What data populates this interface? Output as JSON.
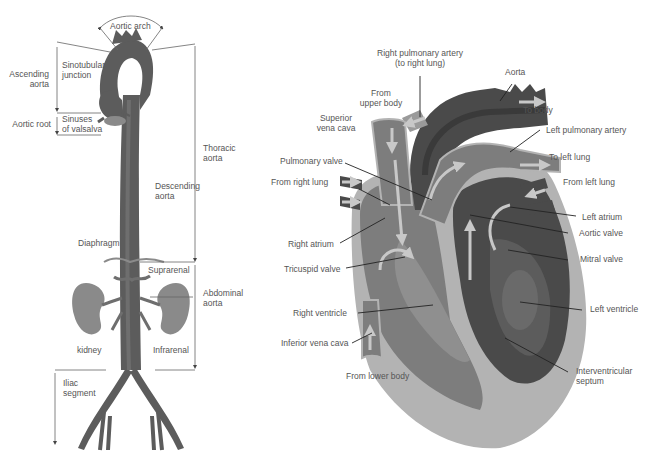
{
  "colors": {
    "background": "#ffffff",
    "label_text": "#555555",
    "leader_line": "#222222",
    "bracket_line": "#666666",
    "aorta_dark": "#5c5c5c",
    "aorta_mid": "#6e6e6e",
    "kidney": "#8a8a8a",
    "heart_outer": "#b3b3b3",
    "heart_mid": "#7d7d7d",
    "heart_dark": "#4a4a4a",
    "heart_darkest": "#3a3a3a",
    "flow_arrow": "#c8c8c8"
  },
  "aorta_diagram": {
    "labels": {
      "aortic_arch": "Aortic arch",
      "ascending_aorta_1": "Ascending",
      "ascending_aorta_2": "aorta",
      "sinotubular_1": "Sinotubular",
      "sinotubular_2": "junction",
      "aortic_root": "Aortic root",
      "sinuses_1": "Sinuses",
      "sinuses_2": "of valsalva",
      "thoracic_1": "Thoracic",
      "thoracic_2": "aorta",
      "descending_1": "Descending",
      "descending_2": "aorta",
      "diaphragm": "Diaphragm",
      "suprarenal": "Suprarenal",
      "abdominal_1": "Abdominal",
      "abdominal_2": "aorta",
      "kidney": "kidney",
      "infrarenal": "Infrarenal",
      "iliac_1": "Iliac",
      "iliac_2": "segment"
    }
  },
  "heart_diagram": {
    "labels": {
      "right_pulmonary_artery_1": "Right pulmonary artery",
      "right_pulmonary_artery_2": "(to right lung)",
      "aorta": "Aorta",
      "to_body": "To body",
      "from_upper_body_1": "From",
      "from_upper_body_2": "upper body",
      "superior_vena_cava_1": "Superior",
      "superior_vena_cava_2": "vena cava",
      "left_pulmonary_artery": "Left pulmonary artery",
      "to_left_lung": "To left lung",
      "pulmonary_valve": "Pulmonary valve",
      "from_right_lung": "From right lung",
      "from_left_lung": "From left lung",
      "left_atrium": "Left atrium",
      "aortic_valve": "Aortic valve",
      "right_atrium": "Right atrium",
      "mitral_valve": "Mitral valve",
      "tricuspid_valve": "Tricuspid valve",
      "left_ventricle": "Left ventricle",
      "right_ventricle": "Right ventricle",
      "inferior_vena_cava": "Inferior vena cava",
      "from_lower_body": "From lower body",
      "interventricular_1": "Interventricular",
      "interventricular_2": "septum"
    }
  }
}
